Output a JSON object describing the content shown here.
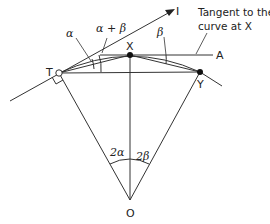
{
  "diagram": {
    "points": {
      "T": {
        "label": "T",
        "x": 59,
        "y": 73
      },
      "X": {
        "label": "X",
        "x": 130,
        "y": 55
      },
      "Y": {
        "label": "Y",
        "x": 200,
        "y": 72
      },
      "O": {
        "label": "O",
        "x": 130,
        "y": 200
      },
      "I": {
        "label": "I",
        "x": 172,
        "y": 10
      },
      "A": {
        "label": "A",
        "x": 213,
        "y": 55
      }
    },
    "angle_labels": {
      "alpha": "α",
      "alpha_plus_beta": "α + β",
      "beta": "β",
      "two_alpha": "2α",
      "two_beta": "2β"
    },
    "annotation": {
      "line1": "Tangent to the",
      "line2": "curve at X"
    },
    "stroke_color": "#333333"
  }
}
